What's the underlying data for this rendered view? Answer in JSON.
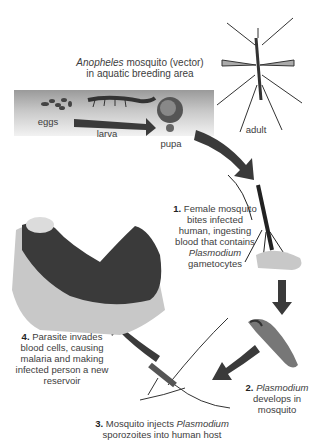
{
  "title": {
    "line1_italic": "Anopheles",
    "line1_rest": " mosquito (vector)",
    "line2": "in aquatic breeding area"
  },
  "breeding_stages": {
    "eggs": "eggs",
    "larva": "larva",
    "pupa": "pupa",
    "adult": "adult"
  },
  "steps": [
    {
      "number": "1.",
      "text_a": "Female mosquito bites infected human, ingesting blood that contains ",
      "italic": "Plasmodium",
      "text_b": " gametocytes"
    },
    {
      "number": "2.",
      "italic": "Plasmodium",
      "text_b": " develops in mosquito"
    },
    {
      "number": "3.",
      "text_a": "Mosquito injects ",
      "italic": "Plasmodium",
      "text_b": " sporozoites into human host"
    },
    {
      "number": "4.",
      "text_a": "Parasite invades blood cells, causing malaria and making infected person a new reservoir"
    }
  ],
  "colors": {
    "arrow": "#3a3a3a",
    "text": "#3d3d3d",
    "box_top": "#9a9a9a",
    "box_bottom": "#f2f2f2"
  }
}
